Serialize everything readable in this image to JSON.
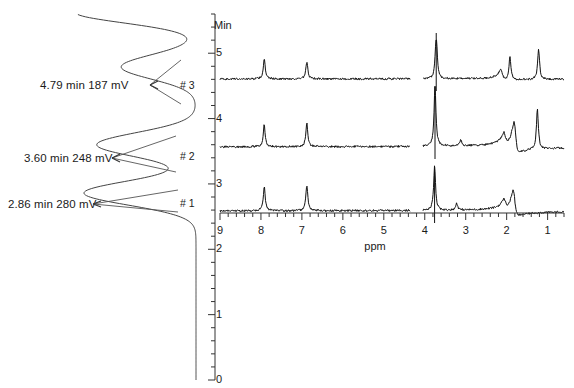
{
  "figure": {
    "kind": "lc-nmr-stacked-figure"
  },
  "chromatogram": {
    "axis_title": "Min",
    "axis_min": 0,
    "axis_max": 5.6,
    "tick_labels": [
      "5",
      "4",
      "3",
      "2",
      "1",
      "0"
    ],
    "tick_values": [
      5,
      4,
      3,
      2,
      1,
      0
    ],
    "minor_tick_step": 0.2,
    "baseline_color": "#333333",
    "trace_color": "#444444",
    "peaks": [
      {
        "tag": "# 1",
        "label": "2.86 min 280 mV",
        "retention_min": 2.86,
        "height_mV": 280
      },
      {
        "tag": "# 2",
        "label": "3.60 min 248 mV",
        "retention_min": 3.6,
        "height_mV": 248
      },
      {
        "tag": "# 3",
        "label": "4.79 min 187 mV",
        "retention_min": 4.79,
        "height_mV": 187
      }
    ]
  },
  "nmr": {
    "axis_title": "ppm",
    "axis_left_ppm": 9,
    "axis_right_ppm": 0.6,
    "tick_labels": [
      "9",
      "8",
      "7",
      "6",
      "5",
      "4",
      "3",
      "2",
      "1"
    ],
    "tick_values": [
      9,
      8,
      7,
      6,
      5,
      4,
      3,
      2,
      1
    ],
    "minor_ticks_per_major": 5,
    "trace_color": "#111111",
    "blanked_region_ppm": [
      4.35,
      4.05
    ],
    "spectra": [
      {
        "name": "spectrum-fraction-3",
        "fraction": "# 3",
        "retention_min": 4.79,
        "peaks": [
          {
            "ppm": 7.92,
            "height": 20
          },
          {
            "ppm": 6.88,
            "height": 17
          },
          {
            "ppm": 3.72,
            "height": 46,
            "clipped": true
          },
          {
            "ppm": 2.12,
            "height": 9,
            "dispersive": true
          },
          {
            "ppm": 1.92,
            "height": 24
          },
          {
            "ppm": 1.22,
            "height": 30
          }
        ]
      },
      {
        "name": "spectrum-fraction-2",
        "fraction": "# 3.60",
        "retention_min": 3.6,
        "peaks": [
          {
            "ppm": 7.92,
            "height": 22
          },
          {
            "ppm": 6.88,
            "height": 24
          },
          {
            "ppm": 3.75,
            "height": 60,
            "clipped": true
          },
          {
            "ppm": 3.12,
            "height": 6
          },
          {
            "ppm": 2.05,
            "height": 10,
            "dispersive": true
          },
          {
            "ppm": 1.8,
            "height": 26,
            "dispersive": true
          },
          {
            "ppm": 1.25,
            "height": 40
          }
        ]
      },
      {
        "name": "spectrum-fraction-1",
        "fraction": "# 1",
        "retention_min": 2.86,
        "peaks": [
          {
            "ppm": 7.92,
            "height": 24
          },
          {
            "ppm": 6.88,
            "height": 26
          },
          {
            "ppm": 3.76,
            "height": 44,
            "clipped": true
          },
          {
            "ppm": 3.22,
            "height": 7
          },
          {
            "ppm": 2.05,
            "height": 8,
            "dispersive": true
          },
          {
            "ppm": 1.82,
            "height": 22,
            "dispersive": true
          }
        ]
      }
    ]
  }
}
